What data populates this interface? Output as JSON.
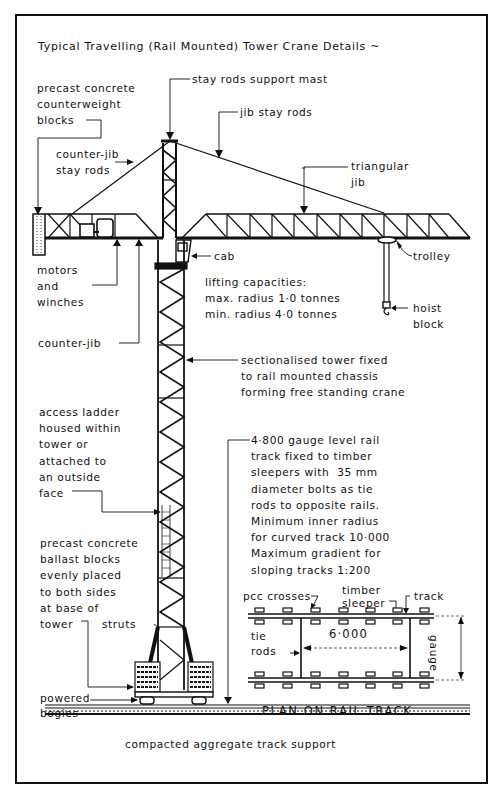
{
  "title": "Typical Travelling (Rail Mounted) Tower Crane Details ~",
  "labels": {
    "stay_rods_support_mast": "stay rods support mast",
    "precast_counterweight": "precast concrete\ncounterweight\nblocks",
    "jib_stay_rods": "jib stay rods",
    "counter_jib_stay_rods": "counter-jib\nstay rods",
    "triangular_jib": "triangular\njib",
    "cab": "cab",
    "trolley": "trolley",
    "motors_winches": "motors\nand\nwinches",
    "lifting_capacities": "lifting capacities:\nmax. radius 1·0 tonnes\nmin. radius 4·0 tonnes",
    "hoist_block": "hoist\nblock",
    "counter_jib": "counter-jib",
    "sectionalised_tower": "sectionalised tower fixed\nto rail mounted chassis\nforming free standing crane",
    "access_ladder": "access ladder\nhoused within\ntower or\nattached to\nan outside\nface",
    "rail_track_note": "4·800 gauge level rail\ntrack fixed to timber\nsleepers with  35 mm\ndiameter bolts as tie\nrods to opposite rails.\nMinimum inner radius\nfor curved track 10·000\nMaximum gradient for\nsloping tracks 1:200",
    "ballast_blocks": "precast concrete\nballast blocks\nevenly placed\nto both sides\nat base of\ntower",
    "struts": "struts",
    "powered_bogies": "powered\nbogies",
    "compacted_aggregate": "compacted aggregate track support"
  },
  "plan": {
    "title": "PLAN ON RAIL TRACK",
    "pcc_crosses": "pcc crosses",
    "timber_sleeper": "timber\nsleeper",
    "track": "track",
    "tie_rods": "tie\nrods",
    "span_dimension": "6·000",
    "gauge": "gauge"
  },
  "colors": {
    "ink": "#111111",
    "paper": "#ffffff"
  }
}
